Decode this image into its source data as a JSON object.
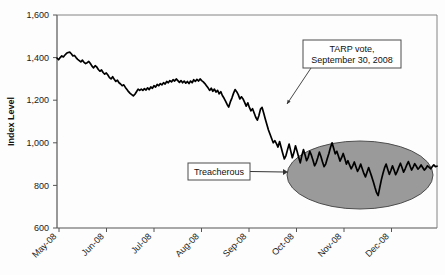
{
  "chart_data": {
    "type": "line",
    "title": "",
    "xlabel": "",
    "ylabel": "Index Level",
    "ylim": [
      600,
      1600
    ],
    "yticks": [
      600,
      800,
      1000,
      1200,
      1400,
      1600
    ],
    "ytick_labels": [
      "600",
      "800",
      "1,000",
      "1,200",
      "1,400",
      "1,600"
    ],
    "xticks": [
      "May-08",
      "Jun-08",
      "Jul-08",
      "Aug-08",
      "Sep-08",
      "Oct-08",
      "Nov-08",
      "Dec-08"
    ],
    "grid": false,
    "legend": "none",
    "series": [
      {
        "name": "Index Level",
        "color": "#000000",
        "values": [
          1398,
          1390,
          1400,
          1408,
          1403,
          1412,
          1420,
          1424,
          1426,
          1418,
          1408,
          1410,
          1400,
          1392,
          1386,
          1380,
          1388,
          1378,
          1372,
          1376,
          1382,
          1372,
          1360,
          1352,
          1362,
          1356,
          1344,
          1336,
          1342,
          1330,
          1322,
          1328,
          1318,
          1306,
          1300,
          1310,
          1298,
          1288,
          1294,
          1282,
          1276,
          1268,
          1272,
          1260,
          1250,
          1240,
          1232,
          1226,
          1220,
          1228,
          1240,
          1252,
          1246,
          1252,
          1246,
          1254,
          1248,
          1258,
          1250,
          1262,
          1256,
          1268,
          1262,
          1274,
          1268,
          1278,
          1272,
          1282,
          1276,
          1288,
          1282,
          1292,
          1286,
          1296,
          1290,
          1300,
          1292,
          1284,
          1292,
          1282,
          1290,
          1280,
          1288,
          1278,
          1290,
          1282,
          1296,
          1288,
          1298,
          1290,
          1300,
          1292,
          1286,
          1278,
          1268,
          1258,
          1246,
          1256,
          1242,
          1252,
          1238,
          1246,
          1230,
          1240,
          1222,
          1210,
          1196,
          1180,
          1168,
          1192,
          1210,
          1232,
          1250,
          1240,
          1226,
          1206,
          1216,
          1206,
          1190,
          1172,
          1188,
          1166,
          1150,
          1160,
          1140,
          1120,
          1106,
          1128,
          1158,
          1166,
          1140,
          1112,
          1086,
          1060,
          1040,
          1020,
          1000,
          1010,
          996,
          980,
          1006,
          978,
          950,
          924,
          940,
          968,
          994,
          962,
          930,
          954,
          986,
          960,
          932,
          906,
          940,
          968,
          944,
          916,
          932,
          960,
          942,
          918,
          892,
          906,
          930,
          956,
          936,
          910,
          888,
          900,
          926,
          950,
          978,
          1000,
          974,
          948,
          960,
          938,
          914,
          930,
          950,
          926,
          900,
          916,
          896,
          878,
          892,
          910,
          888,
          866,
          880,
          900,
          878,
          856,
          840,
          862,
          884,
          862,
          840,
          816,
          790,
          766,
          752,
          790,
          826,
          856,
          882,
          900,
          876,
          852,
          870,
          892,
          872,
          850,
          866,
          886,
          904,
          884,
          862,
          878,
          896,
          912,
          892,
          872,
          886,
          902,
          890,
          876,
          884,
          896,
          884,
          872,
          880,
          892,
          886,
          878,
          888,
          896,
          888,
          890
        ]
      }
    ],
    "annotations": [
      {
        "id": "tarp-vote",
        "text_line1": "TARP vote,",
        "text_line2": "September 30, 2008",
        "box": {
          "x": 303,
          "y": 40,
          "w": 98,
          "h": 28
        },
        "arrow_to": {
          "x": 287,
          "y": 104
        },
        "style": "boxed-callout"
      },
      {
        "id": "treacherous",
        "text_line1": "Treacherous",
        "box": {
          "x": 188,
          "y": 163,
          "w": 62,
          "h": 17
        },
        "arrow_to": {
          "x": 288,
          "y": 172
        },
        "style": "boxed-callout"
      }
    ],
    "highlight_region": {
      "id": "treacherous-ellipse",
      "shape": "ellipse",
      "cx": 360,
      "cy": 175,
      "rx": 73,
      "ry": 34,
      "fill": "#9a9a9a",
      "stroke": "#4d4d4d"
    },
    "plot_area": {
      "left": 57,
      "top": 15,
      "right": 437,
      "bottom": 228
    }
  },
  "colors": {
    "line": "#000000",
    "axis": "#555555",
    "text": "#111111",
    "ellipse_fill": "#9a9a9a",
    "ellipse_stroke": "#4d4d4d",
    "box_border": "#4d4d4d",
    "background": "#fdfdfd"
  }
}
